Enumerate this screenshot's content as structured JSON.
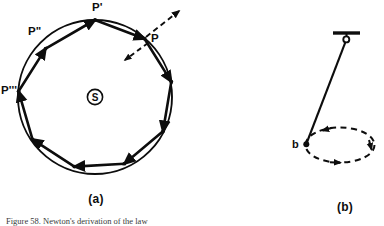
{
  "figure": {
    "panels": [
      {
        "id": "a",
        "caption_label": "(a)",
        "title": "Polygonal approximation of circular orbit",
        "center_label": "S",
        "point_labels": [
          "P",
          "P'",
          "P\"",
          "P'''"
        ],
        "polygon_sides": 9,
        "vector_arrows": [
          {
            "name": "tangential-arrow",
            "style": "dashed",
            "direction": "up-right"
          },
          {
            "name": "centripetal-arrow",
            "style": "dashed",
            "direction": "down-left"
          }
        ]
      },
      {
        "id": "b",
        "caption_label": "(b)",
        "title": "Conical pendulum",
        "bob_label": "b",
        "path_style": "dashed-ellipse",
        "support": "ceiling-bar-with-hook"
      }
    ],
    "caption_text": "Figure 58. Newton's derivation of the law",
    "colors": {
      "ink": "#0d0d0d",
      "paper": "#ffffff",
      "caption_ink": "#3a3a3a"
    }
  }
}
